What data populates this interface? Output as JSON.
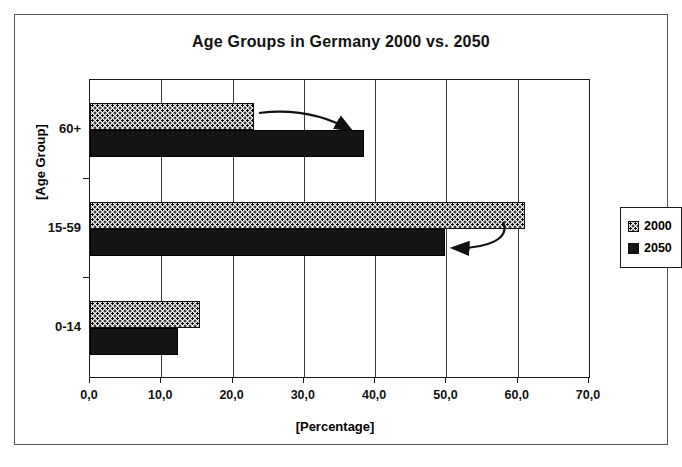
{
  "chart_data": {
    "type": "bar",
    "orientation": "horizontal",
    "title": "Age Groups in Germany 2000 vs. 2050",
    "xlabel": "[Percentage]",
    "ylabel": "[Age Group]",
    "categories": [
      "0-14",
      "15-59",
      "60+"
    ],
    "series": [
      {
        "name": "2000",
        "values": [
          15.5,
          61.0,
          23.0
        ],
        "fill": "dotted-pattern"
      },
      {
        "name": "2050",
        "values": [
          12.3,
          49.8,
          38.4
        ],
        "fill": "solid-black"
      }
    ],
    "xlim": [
      0.0,
      70.0
    ],
    "xticks": [
      0.0,
      10.0,
      20.0,
      30.0,
      40.0,
      50.0,
      60.0,
      70.0
    ],
    "xticklabels": [
      "0,0",
      "10,0",
      "20,0",
      "30,0",
      "40,0",
      "50,0",
      "60,0",
      "70,0"
    ],
    "grid": "vertical",
    "legend_position": "right",
    "annotations": [
      {
        "name": "arrow-60plus-increase",
        "text": "",
        "direction": "right",
        "from_value": 23.0,
        "to_value": 38.4,
        "category": "60+"
      },
      {
        "name": "arrow-15-59-decrease",
        "text": "",
        "direction": "left",
        "from_value": 61.0,
        "to_value": 49.8,
        "category": "15-59"
      }
    ]
  },
  "legend": {
    "entries": [
      {
        "label": "2000",
        "swatch": "dotted-square-icon"
      },
      {
        "label": "2050",
        "swatch": "filled-square-icon"
      }
    ]
  },
  "colors": {
    "series_2000": "#f2f2f2",
    "series_2050": "#151515",
    "axis": "#1a1a1a",
    "grid": "#3a3a3a",
    "frame": "#555555",
    "background": "#ffffff"
  }
}
